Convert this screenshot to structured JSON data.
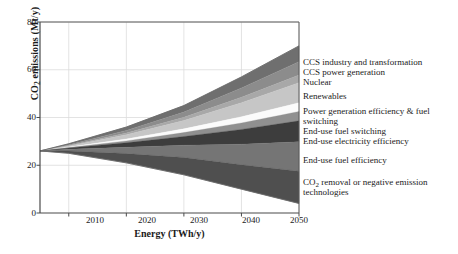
{
  "chart_data": {
    "type": "area",
    "title": "",
    "xlabel": "Energy (TWh/y)",
    "ylabel": "CO2 emissions (Mt/y)",
    "ylabel_prefix": "CO",
    "ylabel_sub": "2",
    "ylabel_suffix": " emissions (Mt/y)",
    "xlim": [
      2005,
      2050
    ],
    "ylim": [
      0,
      80
    ],
    "xticks": [
      2010,
      2020,
      2030,
      2040,
      2050
    ],
    "xtick_labels": [
      "2010",
      "2020",
      "2030",
      "2040",
      "2050"
    ],
    "yticks": [
      0,
      20,
      40,
      60,
      80
    ],
    "ytick_labels": [
      "0",
      "20",
      "40",
      "60",
      "80"
    ],
    "grid": true,
    "legend_position": "right",
    "x": [
      2005,
      2010,
      2020,
      2030,
      2040,
      2050
    ],
    "baseline_name": "Baseline emissions",
    "baseline_values": [
      26,
      29,
      36,
      45,
      57,
      70
    ],
    "actual_name": "Remaining emissions",
    "actual_values": [
      26,
      25,
      21,
      16,
      10,
      4
    ],
    "series": [
      {
        "name": "CCS industry and transformation",
        "color": "#6f6f6f",
        "values": [
          0,
          0.4,
          1.4,
          2.8,
          4.6,
          6.6
        ]
      },
      {
        "name": "CCS power generation",
        "color": "#8c8c8c",
        "values": [
          0,
          0.3,
          1.1,
          2.3,
          3.9,
          5.6
        ]
      },
      {
        "name": "Nuclear",
        "color": "#a8a8a8",
        "values": [
          0,
          0.2,
          0.7,
          1.4,
          2.3,
          3.2
        ]
      },
      {
        "name": "Renewables",
        "color": "#c6c6c6",
        "values": [
          0,
          0.5,
          1.8,
          3.6,
          5.9,
          8.4
        ]
      },
      {
        "name": "Power generation efficiency & fuel switching",
        "color": "#fbfbfb",
        "values": [
          0,
          0.2,
          0.8,
          1.6,
          2.6,
          3.7
        ]
      },
      {
        "name": "End-use fuel switching",
        "color": "#909090",
        "values": [
          0,
          0.2,
          0.8,
          1.7,
          2.7,
          3.9
        ]
      },
      {
        "name": "End-use electricity efficiency",
        "color": "#3d3d3d",
        "values": [
          0,
          0.5,
          1.9,
          3.8,
          6.2,
          8.8
        ]
      },
      {
        "name": "End-use fuel efficiency",
        "color": "#757575",
        "values": [
          0,
          0.7,
          2.6,
          5.3,
          8.6,
          12.3
        ]
      },
      {
        "name": "CO2 removal or negative emission technologies",
        "color": "#4f4f4f",
        "values": [
          0,
          1.0,
          3.9,
          7.5,
          10.2,
          13.5
        ]
      }
    ]
  },
  "legend": {
    "entries": [
      {
        "label": "CCS industry and transformation",
        "top": 0
      },
      {
        "label": "CCS power generation",
        "top": 10.4
      },
      {
        "label": "Nuclear",
        "top": 20.0
      },
      {
        "label": "Renewables",
        "top": 33.5
      },
      {
        "label": "Power generation efficiency & fuel",
        "top": 48.5
      },
      {
        "label": "switching",
        "top": 58.9
      },
      {
        "label": "End-use fuel switching",
        "top": 69.0
      },
      {
        "label": "End-use electricity efficiency",
        "top": 78.6
      },
      {
        "label": "End-use fuel efficiency",
        "top": 97.5
      },
      {
        "label": "removal or negative emission",
        "prefix": "CO",
        "sub": "2",
        "top": 119.5
      },
      {
        "label": "technologies",
        "top": 129.9
      }
    ]
  }
}
